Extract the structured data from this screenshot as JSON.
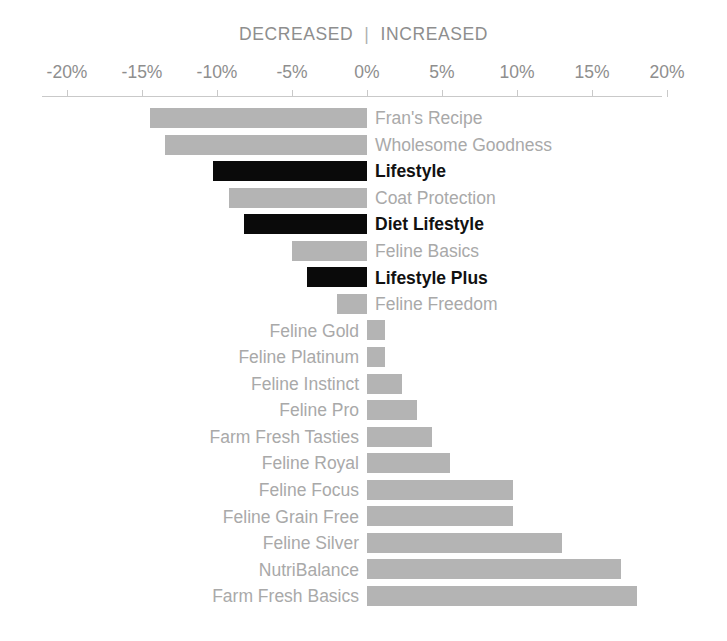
{
  "header": {
    "decreased_label": "DECREASED",
    "separator": "|",
    "increased_label": "INCREASED"
  },
  "colors": {
    "bar_normal": "#b4b4b4",
    "bar_highlight": "#0a0a0a",
    "label_normal": "#a9a9a9",
    "label_highlight": "#111111",
    "axis": "#c9c9c9",
    "header_text": "#8e8e8e",
    "background": "#ffffff"
  },
  "chart_data": {
    "type": "bar",
    "orientation": "horizontal",
    "title": "DECREASED | INCREASED",
    "subtitle": "",
    "xlabel": "",
    "ylabel": "",
    "xlim": [
      -20,
      20
    ],
    "xticks": [
      -20,
      -15,
      -10,
      -5,
      0,
      5,
      10,
      15,
      20
    ],
    "xtick_labels": [
      "-20%",
      "-15%",
      "-10%",
      "-5%",
      "0%",
      "5%",
      "10%",
      "15%",
      "20%"
    ],
    "grid": false,
    "legend": false,
    "units": "percent",
    "categories": [
      "Fran's Recipe",
      "Wholesome Goodness",
      "Lifestyle",
      "Coat Protection",
      "Diet Lifestyle",
      "Feline Basics",
      "Lifestyle Plus",
      "Feline Freedom",
      "Feline Gold",
      "Feline Platinum",
      "Feline Instinct",
      "Feline Pro",
      "Farm Fresh Tasties",
      "Feline Royal",
      "Feline Focus",
      "Feline Grain Free",
      "Feline Silver",
      "NutriBalance",
      "Farm Fresh Basics"
    ],
    "values": [
      -14.5,
      -13.5,
      -10.3,
      -9.2,
      -8.2,
      -5.0,
      -4.0,
      -2.0,
      1.2,
      1.2,
      2.3,
      3.3,
      4.3,
      5.5,
      9.7,
      9.7,
      13.0,
      16.9,
      18.0
    ],
    "highlighted": [
      false,
      false,
      true,
      false,
      true,
      false,
      true,
      false,
      false,
      false,
      false,
      false,
      false,
      false,
      false,
      false,
      false,
      false,
      false
    ]
  },
  "bars": [
    {
      "label": "Fran's Recipe",
      "value": -14.5,
      "highlight": false
    },
    {
      "label": "Wholesome Goodness",
      "value": -13.5,
      "highlight": false
    },
    {
      "label": "Lifestyle",
      "value": -10.3,
      "highlight": true
    },
    {
      "label": "Coat Protection",
      "value": -9.2,
      "highlight": false
    },
    {
      "label": "Diet Lifestyle",
      "value": -8.2,
      "highlight": true
    },
    {
      "label": "Feline Basics",
      "value": -5.0,
      "highlight": false
    },
    {
      "label": "Lifestyle Plus",
      "value": -4.0,
      "highlight": true
    },
    {
      "label": "Feline Freedom",
      "value": -2.0,
      "highlight": false
    },
    {
      "label": "Feline Gold",
      "value": 1.2,
      "highlight": false
    },
    {
      "label": "Feline Platinum",
      "value": 1.2,
      "highlight": false
    },
    {
      "label": "Feline Instinct",
      "value": 2.3,
      "highlight": false
    },
    {
      "label": "Feline Pro",
      "value": 3.3,
      "highlight": false
    },
    {
      "label": "Farm Fresh Tasties",
      "value": 4.3,
      "highlight": false
    },
    {
      "label": "Feline Royal",
      "value": 5.5,
      "highlight": false
    },
    {
      "label": "Feline Focus",
      "value": 9.7,
      "highlight": false
    },
    {
      "label": "Feline Grain Free",
      "value": 9.7,
      "highlight": false
    },
    {
      "label": "Feline Silver",
      "value": 13.0,
      "highlight": false
    },
    {
      "label": "NutriBalance",
      "value": 16.9,
      "highlight": false
    },
    {
      "label": "Farm Fresh Basics",
      "value": 18.0,
      "highlight": false
    }
  ],
  "axis_ticks": [
    {
      "value": -20,
      "label": "-20%"
    },
    {
      "value": -15,
      "label": "-15%"
    },
    {
      "value": -10,
      "label": "-10%"
    },
    {
      "value": -5,
      "label": "-5%"
    },
    {
      "value": 0,
      "label": "0%"
    },
    {
      "value": 5,
      "label": "5%"
    },
    {
      "value": 10,
      "label": "10%"
    },
    {
      "value": 15,
      "label": "15%"
    },
    {
      "value": 20,
      "label": "20%"
    }
  ]
}
